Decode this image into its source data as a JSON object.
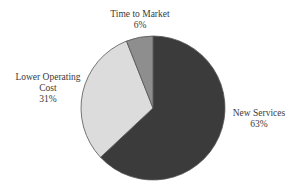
{
  "chart_data": {
    "type": "pie",
    "title": "",
    "categories": [
      "New Services",
      "Lower Operating Cost",
      "Time to Market"
    ],
    "values": [
      63,
      31,
      6
    ],
    "unit": "%",
    "colors": [
      "#3b3b3b",
      "#dcdcdc",
      "#8e8e8e"
    ],
    "labels": [
      {
        "name": "New Services",
        "pct": "63%"
      },
      {
        "name_line1": "Lower Operating",
        "name_line2": "Cost",
        "pct": "31%"
      },
      {
        "name": "Time to Market",
        "pct": "6%"
      }
    ],
    "start_angle_deg": 0,
    "direction": "clockwise",
    "legend": "none"
  }
}
